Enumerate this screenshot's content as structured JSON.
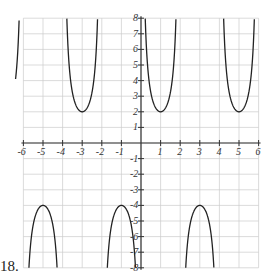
{
  "problem_number": "18.",
  "chart_data": {
    "type": "line",
    "title": "",
    "xlabel": "",
    "ylabel": "",
    "xlim": [
      -6,
      6
    ],
    "ylim": [
      -8,
      8
    ],
    "grid": true,
    "x_ticks": [
      -6,
      -5,
      -4,
      -3,
      -2,
      -1,
      1,
      2,
      3,
      4,
      5,
      6
    ],
    "y_ticks": [
      8,
      7,
      6,
      5,
      4,
      3,
      2,
      1,
      -1,
      -2,
      -3,
      -4,
      -5,
      -6,
      -7,
      -8
    ],
    "function": "y = 3*sec(pi*(x-1)/2) - 1",
    "series": [
      {
        "name": "upward branches",
        "vertices": [
          [
            -3,
            2
          ],
          [
            1,
            2
          ],
          [
            5,
            2
          ]
        ]
      },
      {
        "name": "downward branches",
        "vertices": [
          [
            -5,
            -4
          ],
          [
            -1,
            -4
          ],
          [
            3,
            -4
          ]
        ]
      }
    ],
    "asymptotes_x": [
      -6,
      -4,
      -2,
      0,
      2,
      4,
      6
    ]
  },
  "style": {
    "curve_color": "#222222",
    "grid_color": "#cccccc",
    "axis_color": "#333333"
  }
}
